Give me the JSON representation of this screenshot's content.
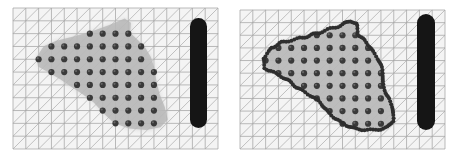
{
  "figure": {
    "width": 456,
    "height": 160,
    "background": "#ffffff",
    "kind": "two-panel-scientific-figure"
  },
  "palette": {
    "background": "#ffffff",
    "mesh_line": "#8f8f8f",
    "mesh_diagonal": "#9c9c9c",
    "mesh_fill": "#f4f4f4",
    "region_fill": "#b3b3b3",
    "region_halo": "#cfcfcf",
    "interior_marker": "#3a3a3a",
    "interior_marker_highlight": "#8a8a8a",
    "boundary_marker": "#2e2e2e",
    "obstacle_bar": "#151515",
    "panel_border": "#c8c8c8"
  },
  "mesh": {
    "columns": 16,
    "rows": 11,
    "cell_size": 12.8,
    "diagonal_direction": "top-right-to-bottom-left",
    "line_width": 0.7
  },
  "panels": [
    {
      "id": "panel-left",
      "index": 0,
      "label": "left",
      "origin_x": 13,
      "origin_y": 8,
      "grid_width": 205,
      "grid_height": 141,
      "shows_boundary_particles": false,
      "interior_particle_count": 92,
      "interior_marker_radius": 3.1,
      "obstacle": {
        "x": 190,
        "y": 18,
        "width": 17,
        "height": 110,
        "corner_radius": 8.5
      }
    },
    {
      "id": "panel-right",
      "index": 1,
      "label": "right",
      "origin_x": 240,
      "origin_y": 10,
      "grid_width": 205,
      "grid_height": 139,
      "shows_boundary_particles": true,
      "interior_particle_count": 92,
      "interior_marker_radius": 3.1,
      "boundary_marker_radius": 2.0,
      "boundary_particle_count": 150,
      "obstacle": {
        "x": 417,
        "y": 14,
        "width": 18,
        "height": 116,
        "corner_radius": 9
      }
    }
  ],
  "region_polygon": [
    [
      0.115,
      0.345
    ],
    [
      0.15,
      0.272
    ],
    [
      0.21,
      0.232
    ],
    [
      0.3,
      0.2
    ],
    [
      0.395,
      0.16
    ],
    [
      0.47,
      0.12
    ],
    [
      0.545,
      0.075
    ],
    [
      0.575,
      0.105
    ],
    [
      0.572,
      0.175
    ],
    [
      0.6,
      0.215
    ],
    [
      0.64,
      0.27
    ],
    [
      0.672,
      0.345
    ],
    [
      0.69,
      0.425
    ],
    [
      0.7,
      0.52
    ],
    [
      0.715,
      0.61
    ],
    [
      0.74,
      0.7
    ],
    [
      0.755,
      0.79
    ],
    [
      0.72,
      0.845
    ],
    [
      0.65,
      0.865
    ],
    [
      0.565,
      0.855
    ],
    [
      0.492,
      0.815
    ],
    [
      0.44,
      0.745
    ],
    [
      0.395,
      0.672
    ],
    [
      0.34,
      0.612
    ],
    [
      0.285,
      0.56
    ],
    [
      0.23,
      0.505
    ],
    [
      0.172,
      0.455
    ],
    [
      0.122,
      0.415
    ]
  ],
  "interior_particle_grid": {
    "start_col": 2,
    "start_row": 1,
    "description": "particles placed on mesh vertices that fall inside the shaded region"
  }
}
